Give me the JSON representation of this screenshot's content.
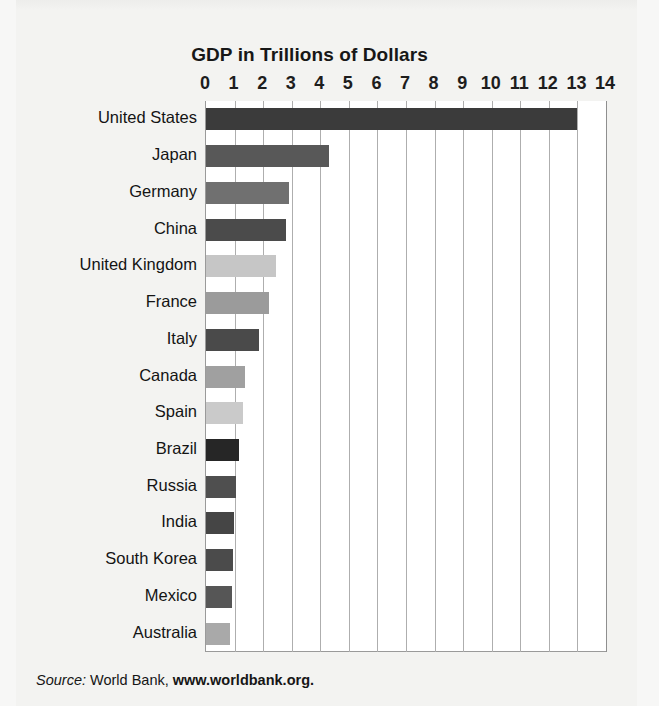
{
  "chart_data": {
    "type": "bar",
    "orientation": "horizontal",
    "title": "GDP in Trillions of Dollars",
    "xlabel": "",
    "ylabel": "",
    "xlim": [
      0,
      14
    ],
    "xticks": [
      0,
      1,
      2,
      3,
      4,
      5,
      6,
      7,
      8,
      9,
      10,
      11,
      12,
      13,
      14
    ],
    "xtick_labels": [
      "0",
      "1",
      "2",
      "3",
      "4",
      "5",
      "6",
      "7",
      "8",
      "9",
      "10",
      "11",
      "12",
      "13",
      "14"
    ],
    "grid": "vertical",
    "legend": "none",
    "units": "Trillions of Dollars",
    "categories": [
      "United States",
      "Japan",
      "Germany",
      "China",
      "United Kingdom",
      "France",
      "Italy",
      "Canada",
      "Spain",
      "Brazil",
      "Russia",
      "India",
      "South Korea",
      "Mexico",
      "Australia"
    ],
    "values": [
      13.0,
      4.3,
      2.9,
      2.8,
      2.45,
      2.2,
      1.85,
      1.35,
      1.3,
      1.15,
      1.05,
      0.97,
      0.95,
      0.9,
      0.85
    ],
    "bar_colors": [
      "#3b3b3b",
      "#585858",
      "#707070",
      "#4b4b4b",
      "#c6c6c6",
      "#9b9b9b",
      "#4a4a4a",
      "#a0a0a0",
      "#cacaca",
      "#262626",
      "#4f4f4f",
      "#454545",
      "#4b4b4b",
      "#565656",
      "#a9a9a9"
    ]
  },
  "source": {
    "prefix": "Source:",
    "organization": "World Bank,",
    "url": "www.worldbank.org."
  },
  "colors": {
    "page_background": "#f3f3f1",
    "plot_background": "#ffffff",
    "gridline": "#aeaeae",
    "text": "#161616"
  }
}
